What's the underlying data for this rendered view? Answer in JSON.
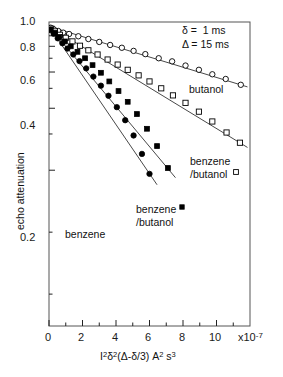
{
  "chart_data": {
    "type": "scatter",
    "title": "",
    "xlabel": "I²δ²(Δ-δ/3) A² s³",
    "xlabel_parts": {
      "i": "I",
      "i_exp": "2",
      "delta_sq": "δ",
      "delta_sq_exp": "2",
      "paren": "(Δ-δ/3)",
      "a": "A",
      "a_exp": "2",
      "s": "s",
      "s_exp": "3"
    },
    "ylabel": "echo attenuation",
    "x_multiplier": "x10",
    "x_multiplier_exp": "-7",
    "xlim": [
      0,
      12
    ],
    "ylim": [
      0.035,
      1.05
    ],
    "yscale": "log",
    "xticks": [
      0,
      2,
      4,
      6,
      8,
      10
    ],
    "xticklabels": [
      "0",
      "2",
      "4",
      "6",
      "8",
      "10"
    ],
    "x_minor_ticks": [
      1,
      3,
      5,
      7,
      9,
      11
    ],
    "yticks": [
      1.0,
      0.8,
      0.6,
      0.4,
      0.2
    ],
    "yticklabels": [
      "1.0",
      "0.8",
      "0.6",
      "0.4",
      "0.2"
    ],
    "y_minor_ticks": [
      0.9,
      0.7,
      0.5,
      0.3,
      0.1,
      0.05
    ],
    "grid": false,
    "legend_position": "inline-annotations",
    "annotations": [
      {
        "name": "delta-small",
        "symbol": "δ",
        "eq": "=",
        "value": "1 ms"
      },
      {
        "name": "delta-large",
        "symbol": "Δ",
        "eq": "=",
        "value": "15 ms"
      }
    ],
    "series": [
      {
        "name": "butanol",
        "label": "butanol",
        "marker": "open-circle",
        "color": "#000000",
        "x": [
          0.1,
          0.3,
          0.55,
          0.85,
          1.2,
          1.75,
          2.35,
          3.0,
          3.65,
          4.35,
          5.05,
          5.75,
          6.55,
          7.35,
          8.15,
          8.95,
          9.75,
          10.55,
          11.45
        ],
        "y": [
          0.985,
          0.965,
          0.95,
          0.932,
          0.918,
          0.895,
          0.868,
          0.84,
          0.812,
          0.787,
          0.76,
          0.733,
          0.7,
          0.676,
          0.645,
          0.615,
          0.585,
          0.555,
          0.52
        ]
      },
      {
        "name": "benzene-butanol-open",
        "label": "benzene /butanol",
        "marker": "open-square",
        "color": "#000000",
        "x": [
          0.1,
          0.35,
          0.65,
          1.0,
          1.4,
          1.85,
          2.35,
          2.9,
          3.5,
          4.1,
          4.7,
          5.35,
          6.0,
          6.7,
          7.4,
          8.15,
          8.95,
          9.75,
          10.6,
          11.4
        ],
        "y": [
          0.975,
          0.945,
          0.91,
          0.88,
          0.845,
          0.805,
          0.765,
          0.73,
          0.69,
          0.652,
          0.615,
          0.578,
          0.54,
          0.5,
          0.462,
          0.425,
          0.385,
          0.345,
          0.305,
          0.272
        ]
      },
      {
        "name": "benzene-butanol-filled",
        "label": "benzene /butanol",
        "marker": "filled-square",
        "color": "#000000",
        "x": [
          0.1,
          0.35,
          0.62,
          0.95,
          1.3,
          1.7,
          2.15,
          2.6,
          3.1,
          3.6,
          4.15,
          4.7,
          5.25,
          5.85,
          6.45,
          7.1
        ],
        "y": [
          0.965,
          0.93,
          0.888,
          0.845,
          0.8,
          0.752,
          0.7,
          0.648,
          0.595,
          0.54,
          0.485,
          0.43,
          0.375,
          0.318,
          0.262,
          0.205
        ]
      },
      {
        "name": "benzene",
        "label": "benzene",
        "marker": "filled-circle",
        "color": "#000000",
        "x": [
          0.08,
          0.28,
          0.52,
          0.8,
          1.1,
          1.45,
          1.82,
          2.22,
          2.65,
          3.1,
          3.55,
          4.05,
          4.55,
          5.05,
          5.55,
          6.0
        ],
        "y": [
          0.96,
          0.92,
          0.875,
          0.828,
          0.78,
          0.73,
          0.678,
          0.625,
          0.57,
          0.515,
          0.46,
          0.405,
          0.35,
          0.295,
          0.24,
          0.192
        ]
      }
    ],
    "fit_lines": [
      {
        "name": "butanol-fit",
        "x0": 0.0,
        "y0": 1.0,
        "x1": 11.85,
        "y1": 0.508
      },
      {
        "name": "benzene-butanol-open-fit",
        "x0": 0.0,
        "y0": 1.0,
        "x1": 11.85,
        "y1": 0.258
      },
      {
        "name": "benzene-butanol-filled-fit",
        "x0": 0.0,
        "y0": 1.0,
        "x1": 7.55,
        "y1": 0.184
      },
      {
        "name": "benzene-fit",
        "x0": 0.0,
        "y0": 1.0,
        "x1": 6.45,
        "y1": 0.17
      }
    ]
  },
  "labels": {
    "butanol": "butanol",
    "benzene_butanol_line1": "benzene",
    "benzene_butanol_line2": "/butanol",
    "benzene_butanol_filled_line1": "benzene",
    "benzene_butanol_filled_line2": "/butanol",
    "benzene": "benzene"
  }
}
